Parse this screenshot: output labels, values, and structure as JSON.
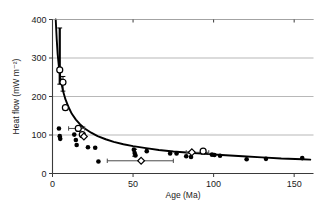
{
  "chart_data": {
    "type": "scatter",
    "title": "",
    "xlabel": "Age (Ma)",
    "ylabel": "Heat flow (mW m⁻²)",
    "xlim": [
      0,
      162
    ],
    "ylim": [
      0,
      400
    ],
    "xticks": [
      0,
      50,
      100,
      150
    ],
    "xtick_labels": [
      "0",
      "50",
      "100",
      "150"
    ],
    "yticks": [
      0,
      100,
      200,
      300,
      400
    ],
    "ytick_labels": [
      "0",
      "100",
      "200",
      "300",
      "400"
    ],
    "grid": "horizontal",
    "legend": "none",
    "series": [
      {
        "name": "Individual heat flow measurements",
        "marker": "filled-circle",
        "points": [
          [
            4.0,
            117
          ],
          [
            4.5,
            97
          ],
          [
            4.8,
            90
          ],
          [
            13.5,
            101
          ],
          [
            14.5,
            87
          ],
          [
            15.0,
            74
          ],
          [
            22.0,
            68
          ],
          [
            26.5,
            67
          ],
          [
            28.5,
            31
          ],
          [
            50.5,
            62
          ],
          [
            51.0,
            53
          ],
          [
            51.5,
            47
          ],
          [
            58.5,
            58
          ],
          [
            73.0,
            52
          ],
          [
            77.0,
            52
          ],
          [
            83.0,
            45
          ],
          [
            86.0,
            43
          ],
          [
            99.0,
            49
          ],
          [
            100.5,
            48
          ],
          [
            104.0,
            46
          ],
          [
            120.5,
            37
          ],
          [
            132.5,
            38
          ],
          [
            155.0,
            40
          ]
        ]
      },
      {
        "name": "Mean heat flow with uncertainty (open circles)",
        "marker": "open-circle",
        "points": [
          [
            4.5,
            269
          ],
          [
            6.5,
            237
          ],
          [
            8.0,
            171
          ],
          [
            16.0,
            117
          ],
          [
            18.5,
            101
          ],
          [
            93.5,
            58
          ]
        ]
      },
      {
        "name": "Age-binned averages (open diamonds)",
        "marker": "open-diamond",
        "points": [
          [
            19.5,
            96
          ],
          [
            55.0,
            33
          ],
          [
            86.5,
            55
          ]
        ]
      }
    ],
    "vertical_error_bars": [
      {
        "x": 4.5,
        "ylow": 232,
        "yhigh": 378
      },
      {
        "x": 6.5,
        "ylow": 214,
        "yhigh": 252
      },
      {
        "x": 51.0,
        "ylow": 45,
        "yhigh": 63
      }
    ],
    "horizontal_error_bars": [
      {
        "y": 117,
        "xlow": 10.0,
        "xhigh": 20.0
      },
      {
        "y": 33,
        "xlow": 34.0,
        "xhigh": 75.0
      },
      {
        "y": 55,
        "xlow": 83.0,
        "xhigh": 97.0
      }
    ],
    "fit_curve": {
      "name": "Theoretical cooling-plate heat flow",
      "description": "Heat flow decays approximately as the inverse square root of crustal age",
      "points": [
        [
          2.0,
          400
        ],
        [
          2.6,
          350
        ],
        [
          3.2,
          310
        ],
        [
          4.0,
          276
        ],
        [
          5.0,
          246
        ],
        [
          6.5,
          215
        ],
        [
          8.0,
          193
        ],
        [
          10.0,
          172
        ],
        [
          12.0,
          155
        ],
        [
          14.5,
          140
        ],
        [
          17.0,
          128
        ],
        [
          20.0,
          117
        ],
        [
          24.0,
          106
        ],
        [
          28.0,
          97
        ],
        [
          33.0,
          89
        ],
        [
          38.0,
          82
        ],
        [
          44.0,
          76
        ],
        [
          50.0,
          71
        ],
        [
          58.0,
          66
        ],
        [
          66.0,
          61
        ],
        [
          75.0,
          57
        ],
        [
          85.0,
          54
        ],
        [
          95.0,
          51
        ],
        [
          105.0,
          48
        ],
        [
          118.0,
          45
        ],
        [
          130.0,
          42
        ],
        [
          142.0,
          39
        ],
        [
          155.0,
          37
        ],
        [
          160.0,
          36
        ]
      ]
    }
  }
}
